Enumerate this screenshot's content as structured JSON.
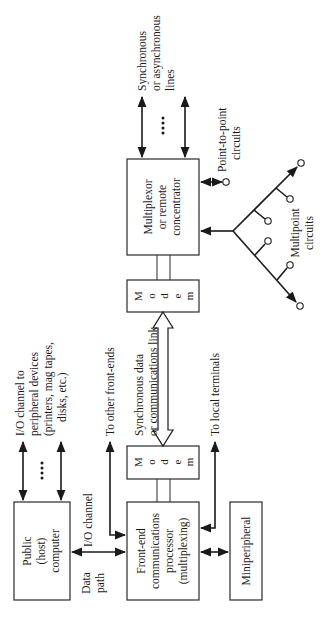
{
  "diagram": {
    "orientation": "rotated-90-ccw",
    "nodes": {
      "host": [
        "Public",
        "(host)",
        "computer"
      ],
      "frontend": [
        "Front-end",
        "communications",
        "processor",
        "(multiplexing)"
      ],
      "miniperipheral": "Miniperipheral",
      "modem_local": [
        "M",
        "o",
        "d",
        "e",
        "m"
      ],
      "modem_remote": [
        "M",
        "o",
        "d",
        "e",
        "m"
      ],
      "multiplexor": [
        "Multiplexor",
        "or remote",
        "concentrator"
      ]
    },
    "labels": {
      "io_peripheral": [
        "I/O channel to",
        "peripheral devices",
        "(printers, mag tapes,",
        "disks, etc.)"
      ],
      "io_channel": "I/O channel",
      "data_path": [
        "Data",
        "path"
      ],
      "other_frontends": "To other front-ends",
      "comm_link": [
        "Synchronous data",
        "or communications link"
      ],
      "local_terminals": "To local terminals",
      "sync_lines": [
        "Synchronous",
        "or asynchronous",
        "lines"
      ],
      "point_to_point": [
        "Point-to-point",
        "circuits"
      ],
      "multipoint": [
        "Multipoint",
        "circuits"
      ],
      "ellipsis": "...."
    },
    "edges": [
      {
        "from": "host",
        "to": "peripheral devices",
        "type": "bidirectional",
        "count": "multiple"
      },
      {
        "from": "host",
        "to": "frontend",
        "type": "bidirectional",
        "label": "I/O channel / Data path"
      },
      {
        "from": "frontend",
        "to": "other front-ends",
        "type": "bidirectional"
      },
      {
        "from": "frontend",
        "to": "modem_local",
        "type": "pair-of-lines"
      },
      {
        "from": "modem_local",
        "to": "modem_remote",
        "type": "hollow-bidirectional",
        "label": "Synchronous data or communications link"
      },
      {
        "from": "frontend",
        "to": "local terminals",
        "type": "bidirectional"
      },
      {
        "from": "frontend",
        "to": "miniperipheral",
        "type": "bidirectional"
      },
      {
        "from": "modem_remote",
        "to": "multiplexor",
        "type": "pair-of-lines"
      },
      {
        "from": "multiplexor",
        "to": "sync/async lines",
        "type": "bidirectional",
        "count": "multiple"
      },
      {
        "from": "multiplexor",
        "to": "point-to-point circuits",
        "type": "bidirectional"
      },
      {
        "from": "multiplexor",
        "to": "multipoint circuits",
        "type": "branching"
      }
    ]
  }
}
